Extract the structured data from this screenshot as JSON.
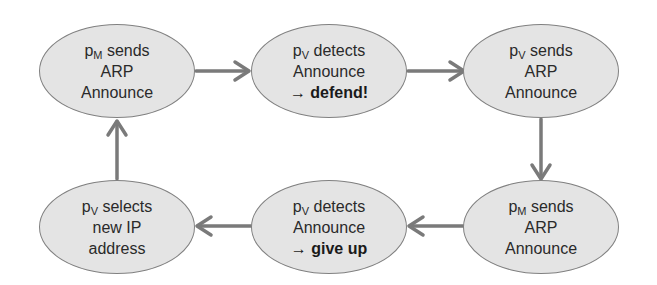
{
  "diagram": {
    "type": "cycle-flowchart",
    "colors": {
      "node_fill": "#e4e4e4",
      "node_border": "#808080",
      "arrow": "#7a7a7a",
      "text": "#2a2a2a"
    },
    "nodes": [
      {
        "id": "n1",
        "lines": [
          {
            "base": "p",
            "sub": "M",
            "rest": " sends"
          },
          {
            "text": "ARP"
          },
          {
            "text": "Announce"
          }
        ]
      },
      {
        "id": "n2",
        "lines": [
          {
            "base": "p",
            "sub": "V",
            "rest": " detects"
          },
          {
            "text": "Announce"
          },
          {
            "arrow": "→",
            "bold": "defend!"
          }
        ]
      },
      {
        "id": "n3",
        "lines": [
          {
            "base": "p",
            "sub": "V",
            "rest": " sends"
          },
          {
            "text": "ARP"
          },
          {
            "text": "Announce"
          }
        ]
      },
      {
        "id": "n4",
        "lines": [
          {
            "base": "p",
            "sub": "M",
            "rest": " sends"
          },
          {
            "text": "ARP"
          },
          {
            "text": "Announce"
          }
        ]
      },
      {
        "id": "n5",
        "lines": [
          {
            "base": "p",
            "sub": "V",
            "rest": " detects"
          },
          {
            "text": "Announce"
          },
          {
            "arrow": "→",
            "bold": "give up"
          }
        ]
      },
      {
        "id": "n6",
        "lines": [
          {
            "base": "p",
            "sub": "V",
            "rest": " selects"
          },
          {
            "text": "new IP"
          },
          {
            "text": "address"
          }
        ]
      }
    ],
    "edges": [
      {
        "from": "n1",
        "to": "n2"
      },
      {
        "from": "n2",
        "to": "n3"
      },
      {
        "from": "n3",
        "to": "n4"
      },
      {
        "from": "n4",
        "to": "n5"
      },
      {
        "from": "n5",
        "to": "n6"
      },
      {
        "from": "n6",
        "to": "n1"
      }
    ]
  }
}
